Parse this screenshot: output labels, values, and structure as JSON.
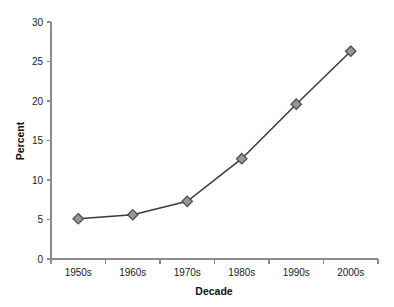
{
  "chart_data": {
    "type": "line",
    "title": "",
    "xlabel": "Decade",
    "ylabel": "Percent",
    "categories": [
      "1950s",
      "1960s",
      "1970s",
      "1980s",
      "1990s",
      "2000s"
    ],
    "values": [
      5.1,
      5.6,
      7.3,
      12.7,
      19.6,
      26.3
    ],
    "series": [
      {
        "name": "Percent",
        "values": [
          5.1,
          5.6,
          7.3,
          12.7,
          19.6,
          26.3
        ]
      }
    ],
    "ylim": [
      0,
      30
    ],
    "yticks": [
      0,
      5,
      10,
      15,
      20,
      25,
      30
    ],
    "ytick_labels": [
      "0",
      "5",
      "10",
      "15",
      "20",
      "25",
      "30"
    ],
    "grid": false,
    "legend": false,
    "legend_position": "none",
    "marker": "diamond",
    "marker_color": "#969696",
    "marker_edge_color": "#4a4a4a",
    "line_color": "#3a3a3a",
    "axis_color": "#8c8c8c",
    "background_color": "#ffffff"
  }
}
